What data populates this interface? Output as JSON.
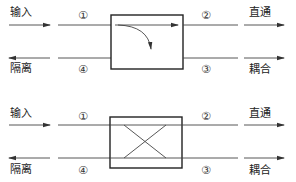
{
  "diagrams": [
    {
      "id": "coupler-curved",
      "inner_symbol": "curved-arrow",
      "labels": {
        "input": "输入",
        "isolated": "隔离",
        "through": "直通",
        "coupled": "耦合"
      },
      "ports": {
        "p1": "①",
        "p2": "②",
        "p3": "③",
        "p4": "④"
      }
    },
    {
      "id": "coupler-cross",
      "inner_symbol": "cross",
      "labels": {
        "input": "输入",
        "isolated": "隔离",
        "through": "直通",
        "coupled": "耦合"
      },
      "ports": {
        "p1": "①",
        "p2": "②",
        "p3": "③",
        "p4": "④"
      }
    }
  ],
  "colors": {
    "line": "#444444",
    "box": "#222222",
    "text": "#222222"
  }
}
